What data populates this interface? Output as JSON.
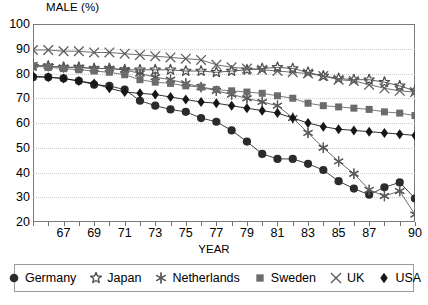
{
  "chart_data": {
    "type": "line",
    "title": "MALE (%)",
    "ylabel": "MALE (%)",
    "xlabel": "YEAR",
    "ylim": [
      20,
      100
    ],
    "yticks": [
      20,
      30,
      40,
      50,
      60,
      70,
      80,
      90,
      100
    ],
    "xlim": [
      1965,
      1990
    ],
    "xtick_labels": [
      "67",
      "69",
      "71",
      "73",
      "75",
      "77",
      "79",
      "81",
      "83",
      "85",
      "87",
      "90"
    ],
    "xtick_years": [
      1967,
      1969,
      1971,
      1973,
      1975,
      1977,
      1979,
      1981,
      1983,
      1985,
      1987,
      1990
    ],
    "grid": "horizontal-dotted",
    "legend_position": "bottom",
    "x": [
      1965,
      1966,
      1967,
      1968,
      1969,
      1970,
      1971,
      1972,
      1973,
      1974,
      1975,
      1976,
      1977,
      1978,
      1979,
      1980,
      1981,
      1982,
      1983,
      1984,
      1985,
      1986,
      1987,
      1988,
      1989,
      1990
    ],
    "series": [
      {
        "name": "Germany",
        "marker": "filled-circle",
        "color": "#2b2b2b",
        "values": [
          78.5,
          78.5,
          78.0,
          77.0,
          75.5,
          75.0,
          73.5,
          69.0,
          67.0,
          65.5,
          64.5,
          62.0,
          60.5,
          57.0,
          52.5,
          47.5,
          45.5,
          45.5,
          43.5,
          41.0,
          36.5,
          33.5,
          31.0,
          34.0,
          36.0,
          29.5
        ]
      },
      {
        "name": "Japan",
        "marker": "star",
        "color": "#4a4a4a",
        "values": [
          83.0,
          83.0,
          82.5,
          82.5,
          82.0,
          82.0,
          81.5,
          81.5,
          81.5,
          81.5,
          81.0,
          81.0,
          80.5,
          81.0,
          81.5,
          82.0,
          82.5,
          82.0,
          80.5,
          79.0,
          78.0,
          77.5,
          77.5,
          76.5,
          75.0,
          73.0
        ]
      },
      {
        "name": "Netherlands",
        "marker": "asterisk",
        "color": "#5a5a5a",
        "values": [
          83.5,
          83.0,
          82.5,
          82.5,
          82.0,
          82.0,
          81.5,
          80.0,
          78.5,
          77.5,
          76.0,
          74.5,
          73.0,
          71.5,
          70.0,
          68.5,
          67.0,
          62.0,
          56.0,
          50.0,
          44.5,
          39.5,
          33.0,
          30.5,
          32.5,
          23.0
        ]
      },
      {
        "name": "Sweden",
        "marker": "filled-square",
        "color": "#6b6b6b",
        "values": [
          83.0,
          82.5,
          82.0,
          81.5,
          81.0,
          80.5,
          79.5,
          77.5,
          76.5,
          76.0,
          75.0,
          74.5,
          73.5,
          73.0,
          72.5,
          72.0,
          71.0,
          70.0,
          68.0,
          67.0,
          66.5,
          66.0,
          65.5,
          64.5,
          64.0,
          63.0
        ]
      },
      {
        "name": "UK",
        "marker": "x-cross",
        "color": "#5f5f5f",
        "values": [
          89.5,
          89.5,
          89.0,
          89.0,
          88.5,
          88.5,
          88.0,
          87.5,
          87.0,
          86.5,
          86.0,
          85.5,
          83.5,
          82.5,
          82.0,
          81.5,
          81.0,
          80.5,
          80.0,
          79.0,
          77.5,
          77.0,
          75.5,
          74.0,
          73.0,
          72.5
        ]
      },
      {
        "name": "USA",
        "marker": "filled-diamond",
        "color": "#171717",
        "values": [
          79.0,
          78.5,
          78.0,
          77.0,
          76.0,
          74.0,
          72.5,
          72.0,
          71.5,
          70.5,
          69.5,
          68.5,
          68.0,
          67.0,
          66.0,
          65.0,
          64.0,
          62.0,
          60.0,
          58.5,
          57.5,
          57.0,
          56.5,
          56.0,
          55.5,
          55.0
        ]
      }
    ]
  },
  "legend": {
    "items": [
      {
        "label": "Germany"
      },
      {
        "label": "Japan"
      },
      {
        "label": "Netherlands"
      },
      {
        "label": "Sweden"
      },
      {
        "label": "UK"
      },
      {
        "label": "USA"
      }
    ]
  }
}
